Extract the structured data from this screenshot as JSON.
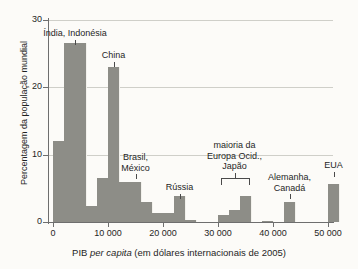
{
  "chart_data": {
    "type": "bar",
    "title": "",
    "xlabel_parts": {
      "pre": "PIB ",
      "italic": "per capita",
      "post": " (em dólares internacionais de 2005)"
    },
    "xlabel": "PIB per capita (em dólares internacionais de 2005)",
    "ylabel": "Percentagem da população mundial",
    "xlim": [
      0,
      52000
    ],
    "ylim": [
      0,
      30
    ],
    "xticks": [
      0,
      10000,
      20000,
      30000,
      40000,
      50000
    ],
    "xticklabels": [
      "0",
      "10 000",
      "20 000",
      "30 000",
      "40 000",
      "50 000"
    ],
    "yticks": [
      0,
      10,
      20,
      30
    ],
    "yticklabels": [
      "0",
      "10",
      "20",
      "30"
    ],
    "grid": "horizontal",
    "legend": "none",
    "bin_width": 2000,
    "bar_color": "#8d8d87",
    "bins": [
      {
        "x0": 0,
        "x1": 2000,
        "value": 12.0
      },
      {
        "x0": 2000,
        "x1": 4000,
        "value": 26.6
      },
      {
        "x0": 4000,
        "x1": 6000,
        "value": 26.6
      },
      {
        "x0": 6000,
        "x1": 8000,
        "value": 2.4
      },
      {
        "x0": 8000,
        "x1": 10000,
        "value": 6.6
      },
      {
        "x0": 10000,
        "x1": 12000,
        "value": 23.0
      },
      {
        "x0": 12000,
        "x1": 14000,
        "value": 6.0
      },
      {
        "x0": 14000,
        "x1": 16000,
        "value": 6.0
      },
      {
        "x0": 16000,
        "x1": 18000,
        "value": 3.0
      },
      {
        "x0": 18000,
        "x1": 20000,
        "value": 1.4
      },
      {
        "x0": 20000,
        "x1": 22000,
        "value": 1.4
      },
      {
        "x0": 22000,
        "x1": 24000,
        "value": 3.8
      },
      {
        "x0": 24000,
        "x1": 26000,
        "value": 0.3
      },
      {
        "x0": 26000,
        "x1": 30000,
        "value": 0.0
      },
      {
        "x0": 30000,
        "x1": 32000,
        "value": 1.0
      },
      {
        "x0": 32000,
        "x1": 34000,
        "value": 1.8
      },
      {
        "x0": 34000,
        "x1": 36000,
        "value": 3.9
      },
      {
        "x0": 38000,
        "x1": 40000,
        "value": 0.2
      },
      {
        "x0": 42000,
        "x1": 44000,
        "value": 3.0
      },
      {
        "x0": 50000,
        "x1": 52000,
        "value": 5.6
      }
    ],
    "annotations": [
      {
        "id": "india-indonesia",
        "text": "Índia, Indonésia",
        "lines": [
          "Índia, Indonésia"
        ],
        "points_to_x": 4000,
        "marker": "leader"
      },
      {
        "id": "china",
        "text": "China",
        "lines": [
          "China"
        ],
        "points_to_x": 11000,
        "marker": "leader"
      },
      {
        "id": "brasil-mexico",
        "text": "Brasil, México",
        "lines": [
          "Brasil,",
          "México"
        ],
        "points_to_x": 15000,
        "marker": "leader"
      },
      {
        "id": "russia",
        "text": "Rússia",
        "lines": [
          "Rússia"
        ],
        "points_to_x": 23000,
        "marker": "leader"
      },
      {
        "id": "europa-ocidental-japao",
        "text": "maioria da Europa Ocid., Japão",
        "lines": [
          "maioria da",
          "Europa Ocid.,",
          "Japão"
        ],
        "points_to_x": 33000,
        "marker": "bracket",
        "bracket_from_x": 30500,
        "bracket_to_x": 35500
      },
      {
        "id": "alemanha-canada",
        "text": "Alemanha, Canadá",
        "lines": [
          "Alemanha,",
          "Canadá"
        ],
        "points_to_x": 43000,
        "marker": "leader"
      },
      {
        "id": "eua",
        "text": "EUA",
        "lines": [
          "EUA"
        ],
        "points_to_x": 51000,
        "marker": "leader"
      }
    ]
  }
}
